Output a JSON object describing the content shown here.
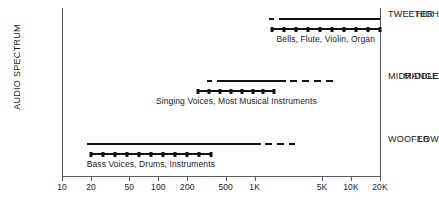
{
  "chart_data": {
    "type": "line",
    "title": "",
    "xlabel": "",
    "ylabel": "AUDIO SPECTRUM",
    "grid": false,
    "legend": "none",
    "x_scale": "log",
    "xlim": [
      10,
      20000
    ],
    "x_tick_labels": [
      "10",
      "20",
      "50",
      "100",
      "200",
      "500",
      "1K",
      "5K",
      "10K",
      "20K"
    ],
    "x_tick_values": [
      10,
      20,
      50,
      100,
      200,
      500,
      1000,
      5000,
      10000,
      20000
    ],
    "y_categories": [
      "HIGH",
      "MIDDLE",
      "LOW"
    ],
    "right_axis_labels": [
      "TWEETER",
      "MIDRANGE",
      "WOOFER"
    ],
    "series": [
      {
        "name": "TWEETER",
        "y_category": "HIGH",
        "caption": "Bells, Flute, Violin, Organ",
        "range_line": {
          "dashed_start_hz": 1400,
          "solid_start_hz": 1900,
          "solid_end_hz": 20000,
          "style": "dashed-then-solid"
        },
        "dotted_range_hz": [
          1500,
          20000
        ],
        "dot_count": 10
      },
      {
        "name": "MIDRANGE",
        "y_category": "MIDDLE",
        "caption": "Singing Voices, Most Musical Instruments",
        "range_line": {
          "dashed_start_hz": 320,
          "solid_start_hz": 420,
          "solid_end_hz": 2100,
          "dashed_end_hz": 6500,
          "style": "dash-solid-dash"
        },
        "dotted_range_hz": [
          260,
          1600
        ],
        "dot_count": 8
      },
      {
        "name": "WOOFER",
        "y_category": "LOW",
        "caption": "Bass Voices, Drums, Instruments",
        "range_line": {
          "solid_start_hz": 18,
          "solid_end_hz": 1150,
          "dashed_end_hz": 2600,
          "style": "solid-then-dashed"
        },
        "dotted_range_hz": [
          20,
          350
        ],
        "dot_count": 11
      }
    ]
  },
  "axis": {
    "vertical_title": "AUDIO SPECTRUM",
    "y_labels": {
      "high": "HIGH",
      "middle": "MIDDLE",
      "low": "LOW"
    },
    "right_labels": {
      "tweeter": "TWEETER",
      "midrange": "MIDRANGE",
      "woofer": "WOOFER"
    },
    "x_ticks": [
      "10",
      "20",
      "50",
      "100",
      "200",
      "500",
      "1K",
      "5K",
      "10K",
      "20K"
    ]
  },
  "captions": {
    "high": "Bells, Flute, Violin, Organ",
    "middle": "Singing Voices, Most Musical Instruments",
    "low": "Bass Voices, Drums, Instruments"
  },
  "colors": {
    "ink": "#111111",
    "axis": "#5a5a5a",
    "background": "#ffffff"
  }
}
